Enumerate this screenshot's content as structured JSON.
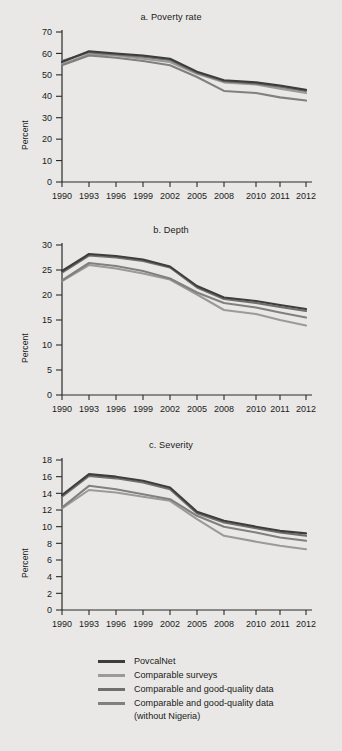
{
  "figure": {
    "background": "#e9e8e6",
    "ylabel": "Percent"
  },
  "legend": {
    "position": "bottom",
    "entries": [
      {
        "label": "PovcalNet",
        "color": "#3d3d3d"
      },
      {
        "label": "Comparable surveys",
        "color": "#9a9a9a"
      },
      {
        "label": "Comparable and good-quality data",
        "color": "#6f6f6f"
      },
      {
        "label": "Comparable and good-quality data\n(without Nigeria)",
        "color": "#808080"
      }
    ]
  },
  "chart_data": [
    {
      "type": "line",
      "title": "a. Poverty rate",
      "xlabel": "",
      "ylabel": "Percent",
      "x": [
        "1990",
        "1993",
        "1996",
        "1999",
        "2002",
        "2005",
        "2008",
        "2010",
        "2011",
        "2012"
      ],
      "ylim": [
        0,
        70
      ],
      "yticks": [
        0,
        10,
        20,
        30,
        40,
        50,
        60,
        70
      ],
      "grid": false,
      "series": [
        {
          "name": "PovcalNet",
          "color": "#3d3d3d",
          "values": [
            56.0,
            61.0,
            60.0,
            59.0,
            57.5,
            51.5,
            47.5,
            46.5,
            45.0,
            43.0
          ]
        },
        {
          "name": "Comparable surveys",
          "color": "#9a9a9a",
          "values": [
            55.0,
            59.5,
            59.0,
            57.5,
            56.0,
            50.5,
            46.5,
            45.5,
            43.5,
            41.5
          ]
        },
        {
          "name": "Comparable and good-quality data",
          "color": "#6f6f6f",
          "values": [
            56.5,
            60.5,
            59.5,
            58.5,
            57.0,
            51.0,
            47.0,
            46.0,
            44.5,
            42.5
          ]
        },
        {
          "name": "Comparable and good-quality data (without Nigeria)",
          "color": "#808080",
          "values": [
            54.5,
            59.0,
            58.0,
            56.5,
            54.5,
            49.0,
            42.5,
            41.5,
            39.5,
            38.0
          ]
        }
      ]
    },
    {
      "type": "line",
      "title": "b. Depth",
      "xlabel": "",
      "ylabel": "Percent",
      "x": [
        "1990",
        "1993",
        "1996",
        "1999",
        "2002",
        "2005",
        "2008",
        "2010",
        "2011",
        "2012"
      ],
      "ylim": [
        0,
        30
      ],
      "yticks": [
        0,
        5,
        10,
        15,
        20,
        25,
        30
      ],
      "grid": false,
      "series": [
        {
          "name": "PovcalNet",
          "color": "#3d3d3d",
          "values": [
            24.8,
            28.2,
            27.8,
            27.1,
            25.7,
            21.8,
            19.5,
            18.8,
            18.0,
            17.2
          ]
        },
        {
          "name": "Comparable surveys",
          "color": "#9a9a9a",
          "values": [
            22.8,
            26.0,
            25.3,
            24.3,
            23.1,
            20.1,
            17.0,
            16.2,
            15.0,
            13.9
          ]
        },
        {
          "name": "Comparable and good-quality data",
          "color": "#6f6f6f",
          "values": [
            24.5,
            27.9,
            27.5,
            26.8,
            25.5,
            21.5,
            19.2,
            18.4,
            17.6,
            16.8
          ]
        },
        {
          "name": "Comparable and good-quality data (without Nigeria)",
          "color": "#808080",
          "values": [
            22.9,
            26.4,
            25.8,
            24.8,
            23.3,
            20.5,
            18.4,
            17.5,
            16.5,
            15.5
          ]
        }
      ]
    },
    {
      "type": "line",
      "title": "c. Severity",
      "xlabel": "",
      "ylabel": "Percent",
      "x": [
        "1990",
        "1993",
        "1996",
        "1999",
        "2002",
        "2005",
        "2008",
        "2010",
        "2011",
        "2012"
      ],
      "ylim": [
        0,
        18
      ],
      "yticks": [
        0,
        2,
        4,
        6,
        8,
        10,
        12,
        14,
        16,
        18
      ],
      "grid": false,
      "series": [
        {
          "name": "PovcalNet",
          "color": "#3d3d3d",
          "values": [
            13.8,
            16.3,
            16.0,
            15.5,
            14.7,
            11.8,
            10.7,
            10.0,
            9.5,
            9.2
          ]
        },
        {
          "name": "Comparable surveys",
          "color": "#9a9a9a",
          "values": [
            12.2,
            14.4,
            14.1,
            13.6,
            13.1,
            10.9,
            8.9,
            8.2,
            7.7,
            7.3
          ]
        },
        {
          "name": "Comparable and good-quality data",
          "color": "#6f6f6f",
          "values": [
            13.6,
            16.1,
            15.8,
            15.3,
            14.5,
            11.6,
            10.5,
            9.8,
            9.3,
            8.9
          ]
        },
        {
          "name": "Comparable and good-quality data (without Nigeria)",
          "color": "#808080",
          "values": [
            12.3,
            14.9,
            14.5,
            13.9,
            13.3,
            11.3,
            10.0,
            9.3,
            8.7,
            8.3
          ]
        }
      ]
    }
  ]
}
